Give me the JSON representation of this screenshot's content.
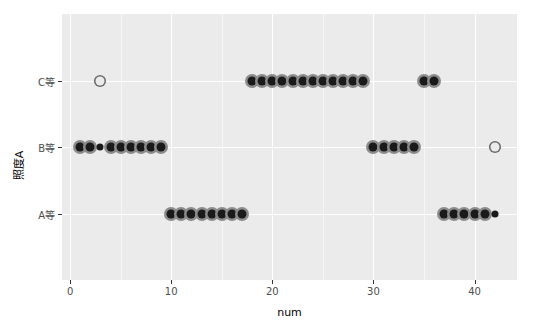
{
  "chart_data": {
    "type": "scatter",
    "title": "",
    "xlabel": "num",
    "ylabel": "照度A",
    "xlim": [
      -0.8,
      44.2
    ],
    "ylim": [
      0.5,
      3.5
    ],
    "grid": true,
    "legend": false,
    "x_ticks": [
      0,
      10,
      20,
      30,
      40
    ],
    "x_tick_labels": [
      "0",
      "10",
      "20",
      "30",
      "40"
    ],
    "y_categories": [
      "A等",
      "B等",
      "C等"
    ],
    "y_tick_labels": [
      "C等",
      "B等",
      "A等"
    ],
    "background_color": "#ebebeb",
    "grid_color": "#ffffff",
    "point_fill_color": "#1a1a1a",
    "point_ring_color": "#8c8c8c",
    "point_open_color": "#6e6e6e",
    "series": [
      {
        "name": "照度A",
        "points": [
          {
            "x": 3,
            "y": "C等",
            "style": "open"
          },
          {
            "x": 18,
            "y": "C等",
            "style": "filled"
          },
          {
            "x": 19,
            "y": "C等",
            "style": "filled"
          },
          {
            "x": 20,
            "y": "C等",
            "style": "filled"
          },
          {
            "x": 21,
            "y": "C等",
            "style": "filled"
          },
          {
            "x": 22,
            "y": "C等",
            "style": "filled"
          },
          {
            "x": 23,
            "y": "C等",
            "style": "filled"
          },
          {
            "x": 24,
            "y": "C等",
            "style": "filled"
          },
          {
            "x": 25,
            "y": "C等",
            "style": "filled"
          },
          {
            "x": 26,
            "y": "C等",
            "style": "filled"
          },
          {
            "x": 27,
            "y": "C等",
            "style": "filled"
          },
          {
            "x": 28,
            "y": "C等",
            "style": "filled"
          },
          {
            "x": 29,
            "y": "C等",
            "style": "filled"
          },
          {
            "x": 35,
            "y": "C等",
            "style": "filled"
          },
          {
            "x": 36,
            "y": "C等",
            "style": "filled"
          },
          {
            "x": 1,
            "y": "B等",
            "style": "filled"
          },
          {
            "x": 2,
            "y": "B等",
            "style": "filled"
          },
          {
            "x": 3,
            "y": "B等",
            "style": "small"
          },
          {
            "x": 4,
            "y": "B等",
            "style": "filled"
          },
          {
            "x": 5,
            "y": "B等",
            "style": "filled"
          },
          {
            "x": 6,
            "y": "B等",
            "style": "filled"
          },
          {
            "x": 7,
            "y": "B等",
            "style": "filled"
          },
          {
            "x": 8,
            "y": "B等",
            "style": "filled"
          },
          {
            "x": 9,
            "y": "B等",
            "style": "filled"
          },
          {
            "x": 30,
            "y": "B等",
            "style": "filled"
          },
          {
            "x": 31,
            "y": "B等",
            "style": "filled"
          },
          {
            "x": 32,
            "y": "B等",
            "style": "filled"
          },
          {
            "x": 33,
            "y": "B等",
            "style": "filled"
          },
          {
            "x": 34,
            "y": "B等",
            "style": "filled"
          },
          {
            "x": 42,
            "y": "B等",
            "style": "open"
          },
          {
            "x": 10,
            "y": "A等",
            "style": "filled"
          },
          {
            "x": 11,
            "y": "A等",
            "style": "filled"
          },
          {
            "x": 12,
            "y": "A等",
            "style": "filled"
          },
          {
            "x": 13,
            "y": "A等",
            "style": "filled"
          },
          {
            "x": 14,
            "y": "A等",
            "style": "filled"
          },
          {
            "x": 15,
            "y": "A等",
            "style": "filled"
          },
          {
            "x": 16,
            "y": "A等",
            "style": "filled"
          },
          {
            "x": 17,
            "y": "A等",
            "style": "filled"
          },
          {
            "x": 37,
            "y": "A等",
            "style": "filled"
          },
          {
            "x": 38,
            "y": "A等",
            "style": "filled"
          },
          {
            "x": 39,
            "y": "A等",
            "style": "filled"
          },
          {
            "x": 40,
            "y": "A等",
            "style": "filled"
          },
          {
            "x": 41,
            "y": "A等",
            "style": "filled"
          },
          {
            "x": 42,
            "y": "A等",
            "style": "small"
          }
        ]
      }
    ]
  }
}
